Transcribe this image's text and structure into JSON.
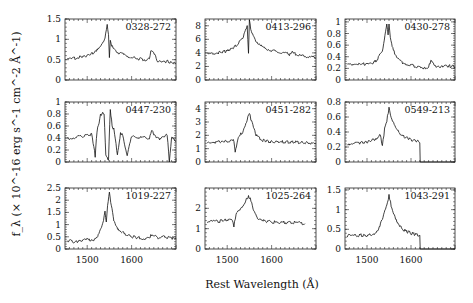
{
  "chart_data": {
    "type": "line",
    "layout": "3x3 grid of spectra panels",
    "xlabel": "Rest Wavelength (Å)",
    "ylabel": "f_λ (× 10^-16 erg s^-1 cm^-2 Å^-1)",
    "xlim": [
      1450,
      1700
    ],
    "xticks": [
      1500,
      1600
    ],
    "grid": false,
    "legend": "none",
    "panels": [
      {
        "name": "0328-272",
        "ylim": [
          0,
          1.5
        ],
        "yticks": [
          "0",
          "0.5",
          "1",
          "1.5"
        ],
        "x": [
          1455,
          1480,
          1500,
          1520,
          1530,
          1540,
          1545,
          1548,
          1550,
          1552,
          1555,
          1560,
          1575,
          1600,
          1630,
          1640,
          1645,
          1660,
          1680,
          1700
        ],
        "y": [
          0.5,
          0.55,
          0.6,
          0.7,
          0.8,
          1.05,
          1.35,
          1.1,
          0.55,
          1.0,
          0.85,
          0.75,
          0.65,
          0.55,
          0.5,
          0.55,
          0.75,
          0.45,
          0.45,
          0.4
        ]
      },
      {
        "name": "0413-296",
        "ylim": [
          0,
          9
        ],
        "yticks": [
          "0",
          "2",
          "4",
          "6",
          "8"
        ],
        "x": [
          1455,
          1480,
          1500,
          1520,
          1535,
          1545,
          1548,
          1550,
          1553,
          1560,
          1575,
          1600,
          1640,
          1645,
          1660,
          1700
        ],
        "y": [
          3.8,
          4.0,
          4.3,
          5.0,
          6.2,
          7.8,
          3.8,
          9.0,
          7.6,
          6.2,
          5.0,
          4.3,
          3.8,
          4.1,
          3.6,
          3.3
        ]
      },
      {
        "name": "0430-278",
        "ylim": [
          0,
          1.05
        ],
        "yticks": [
          "0",
          "0.2",
          "0.4",
          "0.6",
          "0.8",
          "1"
        ],
        "x": [
          1455,
          1480,
          1500,
          1520,
          1535,
          1545,
          1548,
          1550,
          1553,
          1560,
          1575,
          1600,
          1630,
          1640,
          1645,
          1660,
          1680,
          1700
        ],
        "y": [
          0.27,
          0.28,
          0.27,
          0.32,
          0.5,
          0.95,
          0.78,
          0.97,
          0.75,
          0.5,
          0.32,
          0.25,
          0.21,
          0.22,
          0.33,
          0.22,
          0.25,
          0.22
        ]
      },
      {
        "name": "0447-230",
        "ylim": [
          0,
          1
        ],
        "yticks": [
          "0",
          "0.2",
          "0.4",
          "0.6",
          "0.8",
          "1"
        ],
        "x": [
          1455,
          1480,
          1510,
          1518,
          1522,
          1530,
          1538,
          1542,
          1548,
          1552,
          1556,
          1560,
          1568,
          1575,
          1580,
          1590,
          1600,
          1640,
          1645,
          1660,
          1680,
          1685,
          1690,
          1700
        ],
        "y": [
          0.38,
          0.42,
          0.46,
          0.1,
          0.5,
          0.78,
          0.82,
          0.1,
          0.05,
          0.88,
          0.6,
          0.55,
          0.12,
          0.48,
          0.45,
          0.1,
          0.42,
          0.4,
          0.52,
          0.38,
          0.45,
          0.0,
          0.4,
          0.35
        ]
      },
      {
        "name": "0451-282",
        "ylim": [
          0,
          4.5
        ],
        "yticks": [
          "0",
          "1",
          "2",
          "3",
          "4"
        ],
        "x": [
          1455,
          1480,
          1500,
          1515,
          1518,
          1525,
          1535,
          1545,
          1550,
          1555,
          1565,
          1580,
          1600,
          1650,
          1700
        ],
        "y": [
          1.5,
          1.5,
          1.55,
          1.6,
          0.8,
          1.8,
          2.3,
          3.2,
          3.7,
          3.0,
          2.0,
          1.6,
          1.5,
          1.5,
          1.4
        ]
      },
      {
        "name": "0549-213",
        "ylim": [
          0,
          0.8
        ],
        "yticks": [
          "0",
          "0.2",
          "0.4",
          "0.6",
          "0.8"
        ],
        "x": [
          1455,
          1480,
          1500,
          1520,
          1530,
          1535,
          1540,
          1545,
          1550,
          1555,
          1565,
          1580,
          1600,
          1620,
          1621,
          1700
        ],
        "y": [
          0.24,
          0.25,
          0.27,
          0.3,
          0.38,
          0.2,
          0.45,
          0.55,
          0.72,
          0.58,
          0.45,
          0.35,
          0.3,
          0.27,
          0.0,
          0.0
        ]
      },
      {
        "name": "1019-227",
        "ylim": [
          0,
          2.5
        ],
        "yticks": [
          "0",
          "0.5",
          "1",
          "1.5",
          "2",
          "2.5"
        ],
        "x": [
          1455,
          1470,
          1490,
          1515,
          1525,
          1535,
          1540,
          1543,
          1546,
          1550,
          1553,
          1560,
          1570,
          1585,
          1600,
          1620,
          1630,
          1640,
          1645,
          1660,
          1675,
          1690,
          1700
        ],
        "y": [
          0.35,
          0.3,
          0.35,
          0.4,
          0.55,
          1.0,
          1.5,
          1.15,
          1.8,
          2.3,
          1.9,
          1.2,
          0.8,
          0.6,
          0.5,
          0.45,
          0.4,
          0.45,
          0.6,
          0.45,
          0.5,
          0.45,
          0.4
        ]
      },
      {
        "name": "1025-264",
        "ylim": [
          0,
          3
        ],
        "yticks": [
          "0",
          "1",
          "2"
        ],
        "x": [
          1455,
          1480,
          1500,
          1510,
          1515,
          1520,
          1530,
          1540,
          1548,
          1552,
          1560,
          1570,
          1590,
          1620,
          1650,
          1675
        ],
        "y": [
          1.35,
          1.35,
          1.45,
          1.5,
          1.1,
          1.7,
          2.0,
          2.3,
          2.6,
          2.45,
          1.9,
          1.5,
          1.35,
          1.3,
          1.3,
          1.25
        ]
      },
      {
        "name": "1043-291",
        "ylim": [
          0,
          1.55
        ],
        "yticks": [
          "0",
          "0.5",
          "1",
          "1.5"
        ],
        "x": [
          1455,
          1480,
          1500,
          1515,
          1525,
          1535,
          1545,
          1550,
          1555,
          1565,
          1580,
          1600,
          1620,
          1621,
          1700
        ],
        "y": [
          0.33,
          0.35,
          0.35,
          0.38,
          0.5,
          0.75,
          1.1,
          1.35,
          1.1,
          0.75,
          0.5,
          0.4,
          0.35,
          0.0,
          0.0
        ]
      }
    ]
  }
}
